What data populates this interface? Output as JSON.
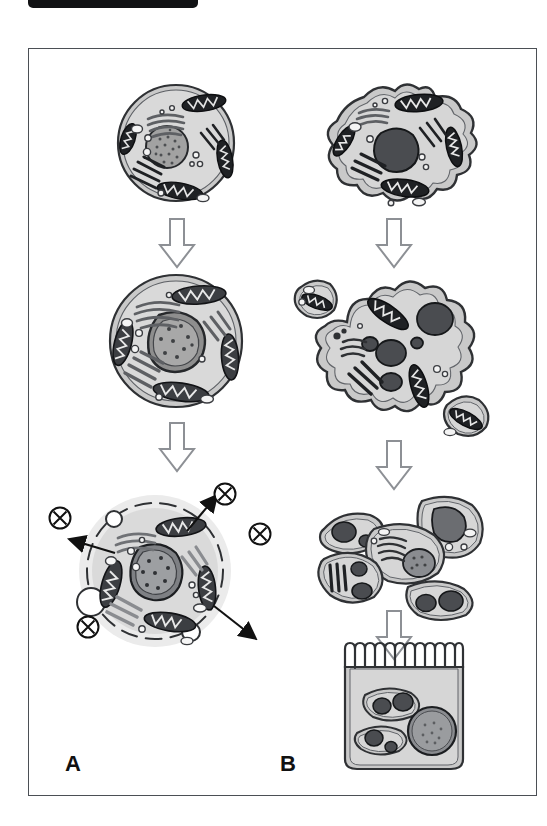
{
  "figure": {
    "frame_present": true,
    "background_color": "#ffffff",
    "border_color": "#4b4f55",
    "top_bar_color": "#111214"
  },
  "panels": [
    {
      "id": "A",
      "letter": "A",
      "name": "panel-a-secretory-pathway",
      "stages": [
        {
          "id": "a1",
          "name": "round-cell-resting",
          "shape": "round",
          "description": "Round cell with small stippled nucleus, Golgi stacks, mitochondria and vesicles"
        },
        {
          "id": "a2",
          "name": "round-cell-activated",
          "shape": "round",
          "description": "Round cell with enlarged irregular nucleus and abundant mitochondria"
        },
        {
          "id": "a3",
          "name": "round-cell-secreting",
          "shape": "round-dashed-halo",
          "description": "Secreting cell with dashed membrane, budding vesicles, outward arrows and released product symbols"
        }
      ],
      "arrows": [
        {
          "name": "block-arrow-a-1",
          "direction": "down"
        },
        {
          "name": "block-arrow-a-2",
          "direction": "down"
        }
      ],
      "secretion_symbols": [
        {
          "name": "secreted-product-symbol",
          "glyph": "circled-x",
          "count": 4
        },
        {
          "name": "secretory-vesicle",
          "glyph": "open-circle",
          "count": 3
        },
        {
          "name": "secretion-arrow",
          "glyph": "thin-arrow",
          "count": 3
        }
      ]
    },
    {
      "id": "B",
      "letter": "B",
      "name": "panel-b-amoeboid-pathway",
      "stages": [
        {
          "id": "b1",
          "name": "amoeboid-cell-single",
          "shape": "amoeboid",
          "description": "Irregular amoeboid cell with dark nucleus, Golgi and mitochondria"
        },
        {
          "id": "b2",
          "name": "amoeboid-cell-multinucleate",
          "shape": "amoeboid-lobed",
          "description": "Large lobed multinucleate cell shedding two small daughter cells"
        },
        {
          "id": "b3",
          "name": "daughter-cell-cluster",
          "shape": "cluster",
          "description": "Cluster of five separated daughter cells each containing nuclei"
        },
        {
          "id": "b4",
          "name": "epithelial-cell-with-engulfed-cells",
          "shape": "columnar-microvilli",
          "description": "Columnar epithelial cell with brush border microvilli containing two engulfed cells and one large round nucleus"
        }
      ],
      "arrows": [
        {
          "name": "block-arrow-b-1",
          "direction": "down"
        },
        {
          "name": "block-arrow-b-2",
          "direction": "down"
        },
        {
          "name": "block-arrow-b-3",
          "direction": "down"
        }
      ]
    }
  ],
  "palette": {
    "cytoplasm": "#c9c9c9",
    "cytoplasm_light": "#d6d6d6",
    "membrane": "#2f3134",
    "nucleus_fill": "#9a9a9a",
    "nucleus_dark": "#5a5a5a",
    "mitochondria": "#1f2124",
    "golgi": "#6f7175",
    "halo": "#e6e6e6",
    "arrow_outline": "#8d9095",
    "frame": "#4b4f55",
    "ink": "#111111"
  }
}
